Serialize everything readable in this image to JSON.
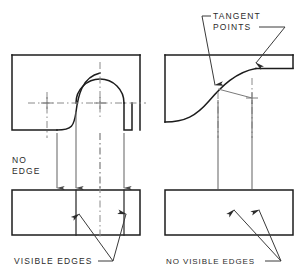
{
  "figure": {
    "background_color": "#ffffff",
    "line_color": "#1c1c1c",
    "projection_line_color": "#6f6f6f",
    "center_line_color": "#8a8a8a"
  },
  "labels": {
    "tangent_points": "TANGENT\nPOINTS",
    "tangent_points_line1": "TANGENT",
    "tangent_points_line2": "POINTS",
    "no_edge_line1": "NO",
    "no_edge_line2": "EDGE",
    "visible_edges": "VISIBLE EDGES",
    "no_visible_edges": "NO VISIBLE EDGES"
  },
  "left_example": {
    "name": "abrupt-tangency-example",
    "top_view": {
      "shape": "rectangle-with-reverse-curve-and-semicircular-arc",
      "x": 12,
      "y": 55,
      "width": 128,
      "height": 75
    },
    "front_view": {
      "shape": "rectangle-with-two-visible-edge-lines",
      "x": 12,
      "y": 190,
      "width": 128,
      "height": 45
    },
    "projection_lines": 4,
    "arrowheads": "down",
    "annotation_left": "NO EDGE",
    "annotation_bottom": "VISIBLE EDGES"
  },
  "right_example": {
    "name": "smooth-tangency-example",
    "top_view": {
      "shape": "rectangle-with-s-curve-and-narrow-slot",
      "x": 165,
      "y": 55,
      "width": 128,
      "height": 75
    },
    "front_view": {
      "shape": "plain-rectangle",
      "x": 165,
      "y": 190,
      "width": 128,
      "height": 45
    },
    "projection_lines": 2,
    "arrowheads": "none",
    "annotation_top": "TANGENT POINTS",
    "annotation_bottom": "NO VISIBLE EDGES"
  }
}
